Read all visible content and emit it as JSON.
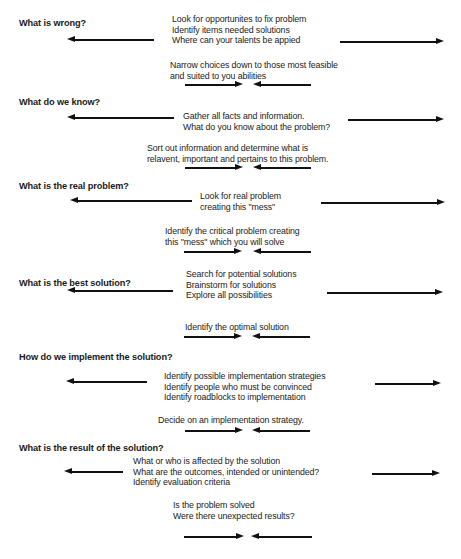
{
  "diagram": {
    "type": "problem-solving-steps",
    "steps": [
      {
        "question": "What is wrong?",
        "diverge_text": "Look for opportunites to fix problem\nIdentify items needed solutions\nWhere can your talents be appied",
        "converge_text": "Narrow choices down to those most feasible\nand suited to you abilities"
      },
      {
        "question": "What do we know?",
        "diverge_text": "Gather all facts and information.\nWhat do you know about the problem?",
        "converge_text": "Sort out information and determine what is\nrelavent, important and pertains to this problem."
      },
      {
        "question": "What is the real problem?",
        "diverge_text": "Look for real problem\ncreating this \"mess\"",
        "converge_text": "Identify the critical problem creating\nthis \"mess\" which you will solve"
      },
      {
        "question": "What is the best solution?",
        "diverge_text": "Search for potential solutions\nBrainstorm for solutions\nExplore all possibilities",
        "converge_text": "Identify the optimal solution"
      },
      {
        "question": "How do we implement the solution?",
        "diverge_text": "Identify possible implementation strategies\nIdentify people who must be convinced\nIdentify roadblocks to implementation",
        "converge_text": "Decide on an implementation strategy."
      },
      {
        "question": "What is the result of the solution?",
        "diverge_text": "What or who is affected by the solution\nWhat are the outcomes, intended or unintended?\nIdentify evaluation criteria",
        "converge_text": "Is the problem solved\nWere there unexpected results?"
      }
    ],
    "arrow_icons": {
      "diverge_left": "arrow-left-icon",
      "diverge_right": "arrow-right-icon",
      "converge_left": "arrow-right-icon",
      "converge_right": "arrow-left-icon"
    },
    "caption": "",
    "colors": {
      "ink": "#111111",
      "text": "#222222",
      "background": "#ffffff"
    }
  }
}
